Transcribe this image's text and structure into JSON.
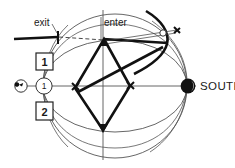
{
  "figure": {
    "background": "#ffffff",
    "width": 235,
    "height": 168
  },
  "labels": {
    "exit": "exit",
    "enter": "enter",
    "south": "SOUTH",
    "box_upper": "1",
    "box_lower": "2",
    "circle_marker": "1"
  },
  "icons": {
    "moon_south": "filled-moon-icon",
    "moon_west": "small-moon-icon"
  },
  "colors": {
    "ink": "#111111",
    "thin_line": "#4a4a4a",
    "background": "#ffffff"
  },
  "geometry": {
    "main_circle": {
      "cx": 115,
      "cy": 86,
      "r": 72
    },
    "horizon_ellipse": {
      "cx": 115,
      "cy": 86,
      "rx": 72,
      "ry": 46
    },
    "horizontal_axis": {
      "x1": 25,
      "y1": 86,
      "x2": 196,
      "y2": 86
    },
    "vertical_axis": {
      "x1": 103,
      "y1": 10,
      "x2": 103,
      "y2": 160
    },
    "kite_vertices": {
      "top": [
        104,
        39
      ],
      "left": [
        75,
        88
      ],
      "right": [
        130,
        86
      ],
      "bottom": [
        103,
        130
      ]
    }
  }
}
